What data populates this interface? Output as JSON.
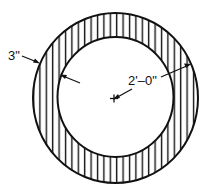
{
  "diagram": {
    "type": "pipe-cross-section",
    "labels": {
      "wall_thickness": "3\"",
      "inner_radius": "2'–0\""
    },
    "colors": {
      "stroke": "#111111",
      "background": "#ffffff"
    }
  }
}
